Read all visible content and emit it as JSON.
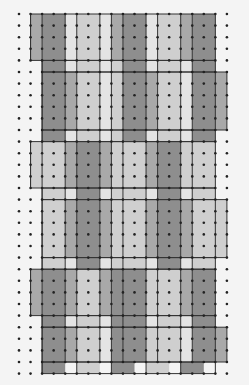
{
  "diagram": {
    "type": "dot-grid tiling pattern",
    "grid": {
      "cols": 19,
      "rows": 32,
      "origin_x": 19,
      "origin_y": 14,
      "step_x": 11.55,
      "step_y": 11.6
    },
    "colors": {
      "background": "#f4f4f4",
      "dot": "#222222",
      "line": "#333333",
      "dark": "#8e8e8e",
      "mid": "#a9a9a9",
      "light": "#cfcfcf",
      "pale": "#e4e4e4"
    },
    "bands": [
      {
        "name": "band-1",
        "row_start": 0,
        "row_end": 4,
        "col_start": 1,
        "col_end": 17,
        "strips": [
          [
            1,
            2,
            "mid"
          ],
          [
            2,
            4,
            "dark"
          ],
          [
            4,
            5,
            "pale"
          ],
          [
            5,
            7,
            "light"
          ],
          [
            7,
            8,
            "pale"
          ],
          [
            8,
            9,
            "mid"
          ],
          [
            9,
            11,
            "dark"
          ],
          [
            11,
            12,
            "pale"
          ],
          [
            12,
            14,
            "light"
          ],
          [
            14,
            15,
            "mid"
          ],
          [
            15,
            17,
            "dark"
          ]
        ]
      },
      {
        "name": "band-1b",
        "row_start": 4,
        "row_end": 5,
        "col_start": 2,
        "col_end": 17,
        "strips": [
          [
            2,
            4,
            "dark"
          ],
          [
            4,
            5,
            "pale"
          ],
          [
            5,
            7,
            "light"
          ],
          [
            7,
            8,
            "pale"
          ],
          [
            8,
            9,
            "light"
          ],
          [
            9,
            11,
            "dark"
          ],
          [
            11,
            12,
            "pale"
          ],
          [
            12,
            14,
            "light"
          ],
          [
            14,
            15,
            "pale"
          ],
          [
            15,
            17,
            "dark"
          ]
        ]
      },
      {
        "name": "band-2",
        "row_start": 5,
        "row_end": 10,
        "col_start": 2,
        "col_end": 18,
        "strips": [
          [
            2,
            4,
            "dark"
          ],
          [
            4,
            5,
            "mid"
          ],
          [
            5,
            7,
            "light"
          ],
          [
            7,
            8,
            "pale"
          ],
          [
            8,
            9,
            "light"
          ],
          [
            9,
            11,
            "dark"
          ],
          [
            11,
            12,
            "mid"
          ],
          [
            12,
            14,
            "light"
          ],
          [
            14,
            15,
            "pale"
          ],
          [
            15,
            17,
            "dark"
          ],
          [
            17,
            18,
            "mid"
          ]
        ]
      },
      {
        "name": "band-2b",
        "row_start": 10,
        "row_end": 11,
        "col_start": 2,
        "col_end": 17,
        "strips": [
          [
            2,
            4,
            "dark"
          ],
          [
            4,
            5,
            "pale"
          ],
          [
            5,
            7,
            "light"
          ],
          [
            7,
            8,
            "pale"
          ],
          [
            8,
            9,
            "light"
          ],
          [
            9,
            11,
            "dark"
          ],
          [
            11,
            12,
            "pale"
          ],
          [
            12,
            14,
            "light"
          ],
          [
            14,
            15,
            "pale"
          ],
          [
            15,
            17,
            "dark"
          ]
        ]
      },
      {
        "name": "band-3",
        "row_start": 11,
        "row_end": 15,
        "col_start": 1,
        "col_end": 17,
        "strips": [
          [
            1,
            2,
            "light"
          ],
          [
            2,
            4,
            "light"
          ],
          [
            4,
            5,
            "mid"
          ],
          [
            5,
            7,
            "dark"
          ],
          [
            7,
            8,
            "mid"
          ],
          [
            8,
            9,
            "light"
          ],
          [
            9,
            11,
            "light"
          ],
          [
            11,
            12,
            "mid"
          ],
          [
            12,
            14,
            "dark"
          ],
          [
            14,
            15,
            "light"
          ],
          [
            15,
            17,
            "light"
          ]
        ]
      },
      {
        "name": "band-3b",
        "row_start": 15,
        "row_end": 16,
        "col_start": 2,
        "col_end": 17,
        "strips": [
          [
            2,
            4,
            "light"
          ],
          [
            4,
            5,
            "pale"
          ],
          [
            5,
            7,
            "dark"
          ],
          [
            7,
            8,
            "pale"
          ],
          [
            8,
            9,
            "light"
          ],
          [
            9,
            11,
            "light"
          ],
          [
            11,
            12,
            "pale"
          ],
          [
            12,
            14,
            "dark"
          ],
          [
            14,
            15,
            "pale"
          ],
          [
            15,
            17,
            "light"
          ]
        ]
      },
      {
        "name": "band-4",
        "row_start": 16,
        "row_end": 21,
        "col_start": 2,
        "col_end": 18,
        "strips": [
          [
            2,
            4,
            "light"
          ],
          [
            4,
            5,
            "mid"
          ],
          [
            5,
            7,
            "dark"
          ],
          [
            7,
            8,
            "mid"
          ],
          [
            8,
            9,
            "light"
          ],
          [
            9,
            11,
            "light"
          ],
          [
            11,
            12,
            "mid"
          ],
          [
            12,
            14,
            "dark"
          ],
          [
            14,
            15,
            "mid"
          ],
          [
            15,
            17,
            "light"
          ],
          [
            17,
            18,
            "light"
          ]
        ]
      },
      {
        "name": "band-4b",
        "row_start": 21,
        "row_end": 22,
        "col_start": 2,
        "col_end": 17,
        "strips": [
          [
            2,
            4,
            "light"
          ],
          [
            4,
            5,
            "pale"
          ],
          [
            5,
            7,
            "dark"
          ],
          [
            7,
            8,
            "pale"
          ],
          [
            8,
            9,
            "light"
          ],
          [
            9,
            11,
            "light"
          ],
          [
            11,
            12,
            "pale"
          ],
          [
            12,
            14,
            "dark"
          ],
          [
            14,
            15,
            "pale"
          ],
          [
            15,
            17,
            "light"
          ]
        ]
      },
      {
        "name": "band-5",
        "row_start": 22,
        "row_end": 26,
        "col_start": 1,
        "col_end": 17,
        "strips": [
          [
            1,
            2,
            "mid"
          ],
          [
            2,
            4,
            "dark"
          ],
          [
            4,
            5,
            "mid"
          ],
          [
            5,
            7,
            "light"
          ],
          [
            7,
            8,
            "mid"
          ],
          [
            8,
            9,
            "dark"
          ],
          [
            9,
            11,
            "dark"
          ],
          [
            11,
            12,
            "light"
          ],
          [
            12,
            14,
            "light"
          ],
          [
            14,
            15,
            "mid"
          ],
          [
            15,
            17,
            "dark"
          ]
        ]
      },
      {
        "name": "band-5b",
        "row_start": 26,
        "row_end": 27,
        "col_start": 2,
        "col_end": 17,
        "strips": [
          [
            2,
            4,
            "dark"
          ],
          [
            4,
            5,
            "pale"
          ],
          [
            5,
            7,
            "light"
          ],
          [
            7,
            8,
            "pale"
          ],
          [
            8,
            9,
            "dark"
          ],
          [
            9,
            11,
            "dark"
          ],
          [
            11,
            12,
            "pale"
          ],
          [
            12,
            14,
            "light"
          ],
          [
            14,
            15,
            "pale"
          ],
          [
            15,
            17,
            "dark"
          ]
        ]
      },
      {
        "name": "band-6",
        "row_start": 27,
        "row_end": 30,
        "col_start": 2,
        "col_end": 18,
        "strips": [
          [
            2,
            4,
            "dark"
          ],
          [
            4,
            5,
            "mid"
          ],
          [
            5,
            7,
            "light"
          ],
          [
            7,
            8,
            "pale"
          ],
          [
            8,
            9,
            "dark"
          ],
          [
            9,
            11,
            "dark"
          ],
          [
            11,
            12,
            "light"
          ],
          [
            12,
            14,
            "light"
          ],
          [
            14,
            15,
            "pale"
          ],
          [
            15,
            17,
            "dark"
          ],
          [
            17,
            18,
            "mid"
          ]
        ]
      },
      {
        "name": "band-6b",
        "row_start": 30,
        "row_end": 31,
        "col_start": 2,
        "col_end": 17,
        "strips": [
          [
            2,
            4,
            "dark"
          ],
          [
            5,
            7,
            "light"
          ],
          [
            8,
            10,
            "dark"
          ],
          [
            11,
            13,
            "light"
          ],
          [
            14,
            16,
            "dark"
          ]
        ]
      }
    ]
  }
}
